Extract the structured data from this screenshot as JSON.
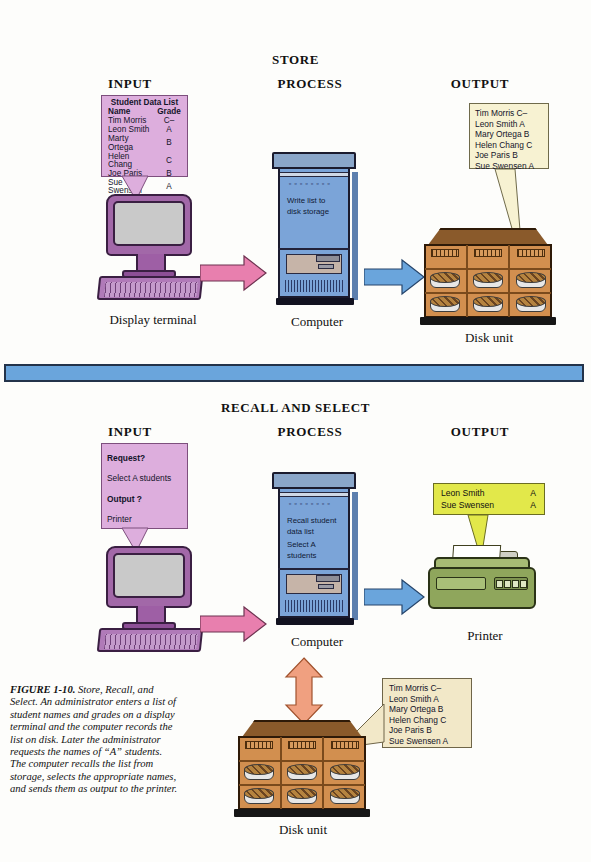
{
  "figure": {
    "number": "FIGURE 1-10.",
    "caption": "Store, Recall, and Select. An administrator enters a list of student names and grades on a display terminal and the computer records the list on disk. Later the administrator requests the names of “A” students. The computer recalls the list from storage, selects the appropriate names, and sends them as output to the printer."
  },
  "colors": {
    "terminal_purple": "#a268a8",
    "callout_purple": "#ddaedd",
    "computer_blue": "#7ba4d8",
    "disk_orange": "#d28f4f",
    "printer_green": "#8fa65c",
    "callout_yellow": "#e2e84a",
    "callout_cream": "#f7f2d2",
    "arrow_pink": "#e87fae",
    "arrow_blue": "#6aa5dc",
    "arrow_salmon": "#f0a080",
    "divider_blue": "#6aa5dc"
  },
  "section_store": {
    "title": "STORE",
    "columns": {
      "input": "INPUT",
      "process": "PROCESS",
      "output": "OUTPUT"
    },
    "input_callout": {
      "title": "Student Data List",
      "header_name": "Name",
      "header_grade": "Grade",
      "rows": [
        {
          "name": "Tim Morris",
          "grade": "C–"
        },
        {
          "name": "Leon Smith",
          "grade": "A"
        },
        {
          "name": "Marty Ortega",
          "grade": "B"
        },
        {
          "name": "Helen Chang",
          "grade": "C"
        },
        {
          "name": "Joe Paris",
          "grade": "B"
        },
        {
          "name": "Sue Swensen",
          "grade": "A"
        }
      ]
    },
    "input_device_label": "Display terminal",
    "process_device_label": "Computer",
    "process_screen_text_line1": "Write list to",
    "process_screen_text_line2": "disk storage",
    "process_leds": "▫▫▫▫▫▫▫▫",
    "output_callout_lines": [
      "Tim Morris C–",
      "Leon Smith A",
      "Mary Ortega B",
      "Helen Chang C",
      "Joe Paris B",
      "Sue Swensen A"
    ],
    "output_device_label": "Disk unit"
  },
  "section_recall": {
    "title": "RECALL AND SELECT",
    "columns": {
      "input": "INPUT",
      "process": "PROCESS",
      "output": "OUTPUT"
    },
    "input_callout_lines": [
      {
        "text": "Request?",
        "bold": true
      },
      {
        "text": "Select A students",
        "bold": false
      },
      {
        "text": "Output ?",
        "bold": true
      },
      {
        "text": "Printer",
        "bold": false
      }
    ],
    "input_device_label": "Display terminal",
    "process_device_label": "Computer",
    "process_screen_text_line1": "Recall student",
    "process_screen_text_line2": "data list",
    "process_screen_text_line3": "Select A",
    "process_screen_text_line4": "students",
    "process_leds": "▫▫▫▫▫▫▫▫",
    "output_callout_rows": [
      {
        "name": "Leon Smith",
        "grade": "A"
      },
      {
        "name": "Sue Swensen",
        "grade": "A"
      }
    ],
    "output_device_label": "Printer",
    "storage_callout_lines": [
      "Tim Morris C–",
      "Leon Smith A",
      "Mary Ortega B",
      "Helen Chang C",
      "Joe Paris B",
      "Sue Swensen A"
    ],
    "storage_device_label": "Disk unit"
  }
}
